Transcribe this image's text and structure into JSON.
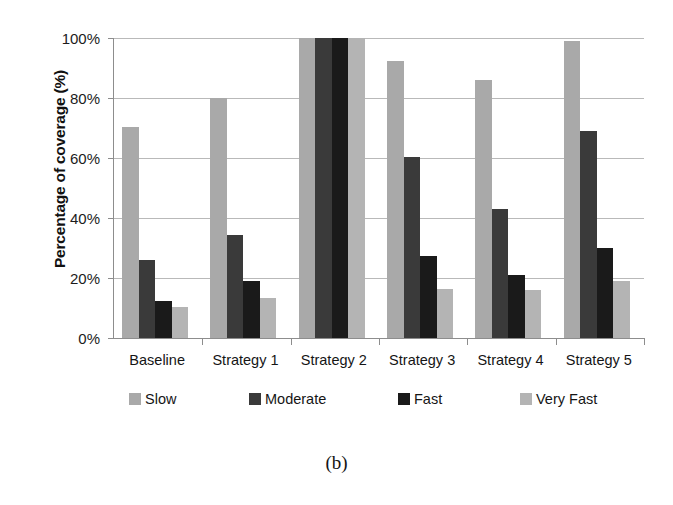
{
  "caption": "(b)",
  "chart_data": {
    "type": "bar",
    "title": "",
    "subtitle": "",
    "xlabel": "",
    "ylabel": "Percentage of coverage (%)",
    "ylim": [
      0,
      100
    ],
    "yticks": [
      0,
      20,
      40,
      60,
      80,
      100
    ],
    "ytick_labels": [
      "0%",
      "20%",
      "40%",
      "60%",
      "80%",
      "100%"
    ],
    "grid": true,
    "legend_position": "bottom",
    "categories": [
      "Baseline",
      "Strategy 1",
      "Strategy 2",
      "Strategy 3",
      "Strategy 4",
      "Strategy 5"
    ],
    "series": [
      {
        "name": "Slow",
        "color": "#a9a9a9",
        "values": [
          70.5,
          80.0,
          100.0,
          92.5,
          86.0,
          99.0
        ]
      },
      {
        "name": "Moderate",
        "color": "#3a3a3a",
        "values": [
          26.0,
          34.5,
          100.0,
          60.5,
          43.0,
          69.0
        ]
      },
      {
        "name": "Fast",
        "color": "#1a1a1a",
        "values": [
          12.5,
          19.0,
          100.0,
          27.5,
          21.0,
          30.0
        ]
      },
      {
        "name": "Very Fast",
        "color": "#b4b4b4",
        "values": [
          10.5,
          13.5,
          100.0,
          16.5,
          16.0,
          19.0
        ]
      }
    ]
  }
}
